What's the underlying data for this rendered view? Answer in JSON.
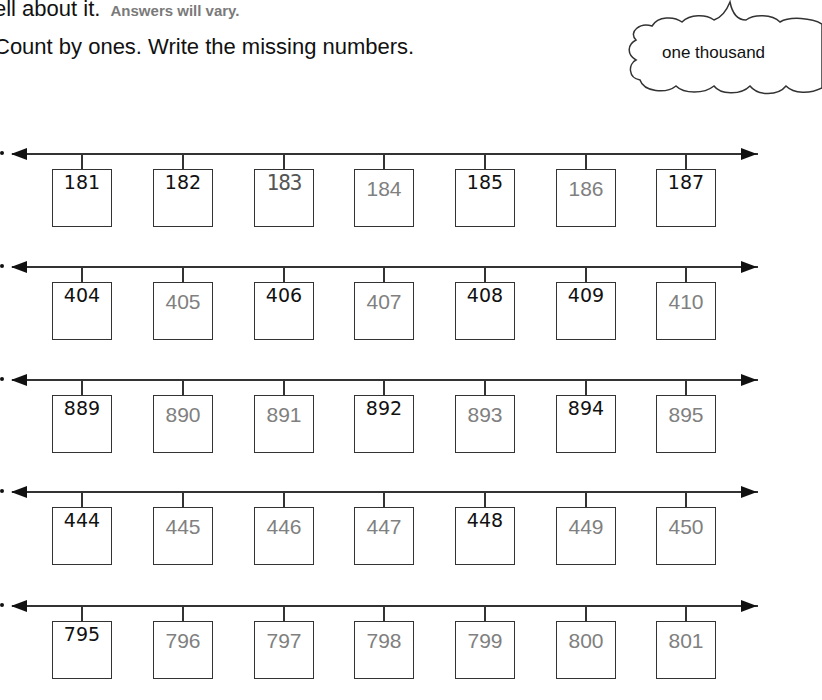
{
  "header": {
    "prompt_tail": "ell about it.",
    "answer_note": "Answers will vary.",
    "instruction": "Count by ones.  Write the missing numbers."
  },
  "cloud": {
    "text": "one thousand",
    "icon": "thought-cloud-icon"
  },
  "colors": {
    "given": "#111111",
    "answer": "#808080",
    "line": "#333333"
  },
  "rows": [
    {
      "cells": [
        {
          "value": "181",
          "kind": "given"
        },
        {
          "value": "182",
          "kind": "given"
        },
        {
          "value": "183",
          "kind": "traced"
        },
        {
          "value": "184",
          "kind": "answer"
        },
        {
          "value": "185",
          "kind": "given"
        },
        {
          "value": "186",
          "kind": "answer"
        },
        {
          "value": "187",
          "kind": "given"
        }
      ]
    },
    {
      "cells": [
        {
          "value": "404",
          "kind": "given"
        },
        {
          "value": "405",
          "kind": "answer"
        },
        {
          "value": "406",
          "kind": "given"
        },
        {
          "value": "407",
          "kind": "answer"
        },
        {
          "value": "408",
          "kind": "given"
        },
        {
          "value": "409",
          "kind": "given"
        },
        {
          "value": "410",
          "kind": "answer"
        }
      ]
    },
    {
      "cells": [
        {
          "value": "889",
          "kind": "given"
        },
        {
          "value": "890",
          "kind": "answer"
        },
        {
          "value": "891",
          "kind": "answer"
        },
        {
          "value": "892",
          "kind": "given"
        },
        {
          "value": "893",
          "kind": "answer"
        },
        {
          "value": "894",
          "kind": "given"
        },
        {
          "value": "895",
          "kind": "answer"
        }
      ]
    },
    {
      "cells": [
        {
          "value": "444",
          "kind": "given"
        },
        {
          "value": "445",
          "kind": "answer"
        },
        {
          "value": "446",
          "kind": "answer"
        },
        {
          "value": "447",
          "kind": "answer"
        },
        {
          "value": "448",
          "kind": "given"
        },
        {
          "value": "449",
          "kind": "answer"
        },
        {
          "value": "450",
          "kind": "answer"
        }
      ]
    },
    {
      "cells": [
        {
          "value": "795",
          "kind": "given"
        },
        {
          "value": "796",
          "kind": "answer"
        },
        {
          "value": "797",
          "kind": "answer"
        },
        {
          "value": "798",
          "kind": "answer"
        },
        {
          "value": "799",
          "kind": "answer"
        },
        {
          "value": "800",
          "kind": "answer"
        },
        {
          "value": "801",
          "kind": "answer"
        }
      ]
    }
  ]
}
